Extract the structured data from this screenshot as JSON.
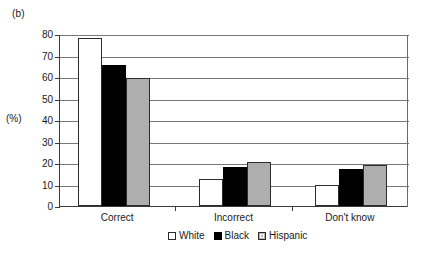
{
  "figure": {
    "panel_label": "(b)",
    "axis_unit_label": "(%)"
  },
  "chart_data": {
    "type": "bar",
    "title": "",
    "subtitle": "",
    "xlabel": "",
    "ylabel": "(%)",
    "ylim": [
      0,
      80
    ],
    "yticks": [
      0,
      10,
      20,
      30,
      40,
      50,
      60,
      70,
      80
    ],
    "ytick_labels": [
      "0",
      "10",
      "20",
      "30",
      "40",
      "50",
      "60",
      "70",
      "80"
    ],
    "grid": true,
    "grid_axis": "y",
    "legend_position": "bottom-center",
    "categories": [
      "Correct",
      "Incorrect",
      "Don't know"
    ],
    "series": [
      {
        "name": "White",
        "color": "#ffffff",
        "values": [
          78,
          12.5,
          10
        ]
      },
      {
        "name": "Black",
        "color": "#000000",
        "values": [
          65.5,
          18,
          17
        ]
      },
      {
        "name": "Hispanic",
        "color": "#aeaeae",
        "values": [
          59.5,
          20.5,
          19
        ]
      }
    ]
  }
}
